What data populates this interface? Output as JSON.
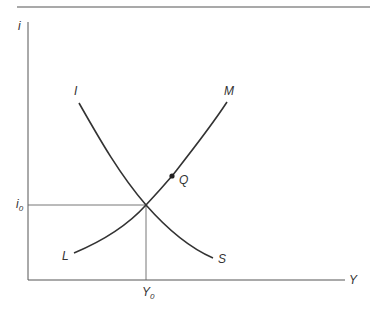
{
  "diagram": {
    "type": "IS-LM",
    "axes": {
      "y_label": "i",
      "x_label": "Y"
    },
    "equilibrium": {
      "i_label": "i",
      "i_sub": "0",
      "y_label": "Y",
      "y_sub": "0"
    },
    "curves": [
      {
        "name": "IS",
        "start_label": "I",
        "end_label": "S"
      },
      {
        "name": "LM",
        "start_label": "L",
        "end_label": "M"
      }
    ],
    "point": {
      "label": "Q"
    }
  },
  "colors": {
    "line": "#333333",
    "rule": "#555555",
    "guide": "#666666"
  }
}
